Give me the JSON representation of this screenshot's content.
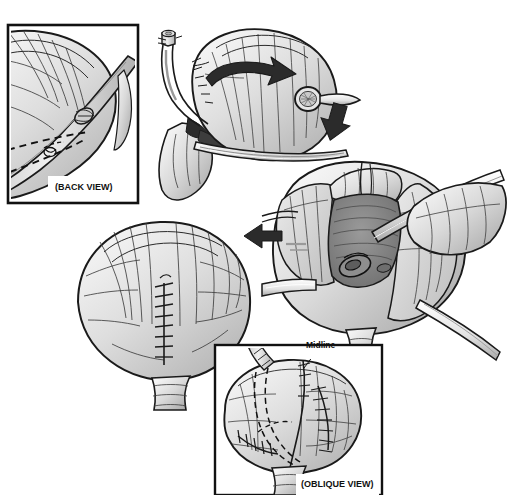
{
  "figure": {
    "caption_top": "Figure 10-14.  Repair of the posterior bladder wall injury (cystotomy closure technique).",
    "background_color": "#ffffff",
    "ink_color": "#1a1a1a",
    "tissue_fill_light": "#efefef",
    "tissue_fill_mid": "#d6d6d6",
    "tissue_fill_dark": "#b3b3b3",
    "arrow_color": "#2b2b2b"
  },
  "panels": [
    {
      "id": "back-view-inset",
      "name": "back-view-inset",
      "label": "(BACK VIEW)",
      "framed": true,
      "x": 8,
      "y": 25,
      "width": 130,
      "height": 178,
      "description": "Posterior bladder wall with ureter crossing; dashed incision line marked."
    },
    {
      "id": "top-mobilization",
      "name": "bladder-mobilization-panel",
      "label": "",
      "framed": false,
      "x": 150,
      "y": 22,
      "width": 205,
      "height": 180,
      "description": "Bladder rotated on its pedicle; catheter stump at upper left, ring retractor at right, curved rotation arrow across the dome."
    },
    {
      "id": "right-exposure",
      "name": "bladder-interior-exposure-panel",
      "label": "",
      "framed": false,
      "x": 262,
      "y": 162,
      "width": 250,
      "height": 190,
      "description": "Opened bladder held by retractors and forceps; trigone and ureteric orifice exposed."
    },
    {
      "id": "left-closure",
      "name": "bladder-closure-panel",
      "label": "",
      "framed": false,
      "x": 72,
      "y": 218,
      "width": 195,
      "height": 175,
      "description": "Bladder closed with a vertical midline running suture line."
    },
    {
      "id": "oblique-view-inset",
      "name": "oblique-view-inset",
      "label": "(OBLIQUE VIEW)",
      "framed": true,
      "x": 215,
      "y": 345,
      "width": 167,
      "height": 150,
      "description": "Oblique view of the reconstructed bladder showing midline and lateral suture rows with dashed internal flap outline."
    }
  ],
  "annotations": [
    {
      "id": "midline",
      "name": "midline-label",
      "text": "Midline",
      "x": 306,
      "y": 340
    },
    {
      "id": "back-view",
      "name": "back-view-label",
      "text": "(BACK VIEW)",
      "x": 55,
      "y": 182
    },
    {
      "id": "oblique-view",
      "name": "oblique-view-label",
      "text": "(OBLIQUE VIEW)",
      "x": 301,
      "y": 479
    }
  ],
  "arrows": [
    {
      "id": "rotation-arrow",
      "name": "rotation-arrow",
      "direction": "curved-right",
      "x": 205,
      "y": 62,
      "description": "Large curved arrow on bladder dome indicating rotation."
    },
    {
      "id": "step-arrow-down",
      "name": "step-arrow-down-right",
      "direction": "down-right",
      "x": 328,
      "y": 108,
      "description": "Arrow leading from mobilization panel to exposure panel."
    },
    {
      "id": "step-arrow-left",
      "name": "step-arrow-left",
      "direction": "left",
      "x": 246,
      "y": 230,
      "description": "Arrow leading from exposure panel to closure panel."
    }
  ]
}
